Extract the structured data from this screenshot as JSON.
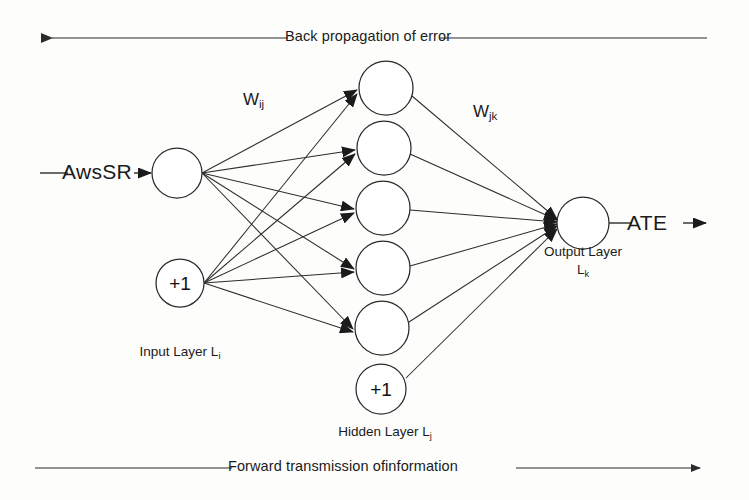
{
  "diagram": {
    "background_color": "#fdfdfc",
    "stroke_color": "#2b2b2b",
    "text_color": "#1b1b1b"
  },
  "bands": {
    "top": {
      "label": "Back propagation of error",
      "direction": "left",
      "y": 38,
      "x_start": 42,
      "x_end": 707
    },
    "bottom": {
      "label": "Forward transmission ofinformation",
      "direction": "right",
      "y": 468,
      "x_start": 35,
      "x_end": 703
    }
  },
  "io": {
    "input_signal": "AwsSR",
    "output_signal": "ATE"
  },
  "weights": {
    "input_to_hidden": {
      "base": "W",
      "sub": "ij",
      "x": 243,
      "y": 98
    },
    "hidden_to_output": {
      "base": "W",
      "sub": "jk",
      "x": 473,
      "y": 110
    }
  },
  "layers": [
    {
      "id": "input",
      "caption_base": "Input Layer L",
      "caption_sub": "i",
      "caption_x": 180,
      "caption_y": 352,
      "nodes": [
        {
          "name": "input-neuron",
          "label": "",
          "cx": 177,
          "cy": 173,
          "r": 25
        },
        {
          "name": "input-bias-neuron",
          "label": "+1",
          "cx": 180,
          "cy": 283,
          "r": 24
        }
      ]
    },
    {
      "id": "hidden",
      "caption_base": "Hidden Layer L",
      "caption_sub": "j",
      "caption_x": 385,
      "caption_y": 432,
      "nodes": [
        {
          "name": "hidden-neuron-1",
          "label": "",
          "cx": 386,
          "cy": 88,
          "r": 27
        },
        {
          "name": "hidden-neuron-2",
          "label": "",
          "cx": 384,
          "cy": 148,
          "r": 27
        },
        {
          "name": "hidden-neuron-3",
          "label": "",
          "cx": 383,
          "cy": 208,
          "r": 27
        },
        {
          "name": "hidden-neuron-4",
          "label": "",
          "cx": 383,
          "cy": 268,
          "r": 27
        },
        {
          "name": "hidden-neuron-5",
          "label": "",
          "cx": 382,
          "cy": 328,
          "r": 27
        },
        {
          "name": "hidden-bias-neuron",
          "label": "+1",
          "cx": 381,
          "cy": 389,
          "r": 25
        }
      ]
    },
    {
      "id": "output",
      "caption_base": "Output Layer",
      "caption_sub": "",
      "caption_x": 583,
      "caption_y": 252,
      "caption_second_base": "L",
      "caption_second_sub": "k",
      "nodes": [
        {
          "name": "output-neuron",
          "label": "",
          "cx": 583,
          "cy": 223,
          "r": 26
        }
      ]
    }
  ],
  "edges": {
    "input_to_hidden_count": 10,
    "hidden_to_output_count": 6,
    "description": "fully connected input+bias to 5 hidden units; 5 hidden units + bias to output"
  }
}
